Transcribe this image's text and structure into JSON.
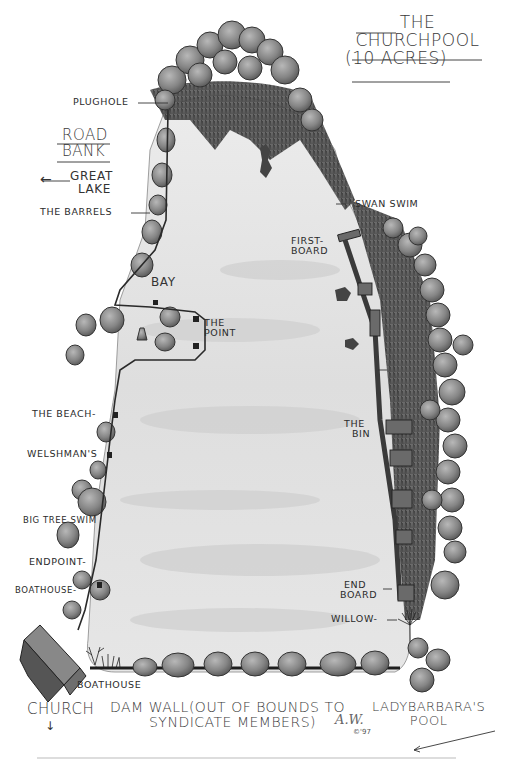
{
  "title": {
    "line1": "THE",
    "line2": "CHURCHPOOL",
    "line3": "(10 ACRES)"
  },
  "left_key": {
    "road_bank_line1": "ROAD",
    "road_bank_line2": "BANK",
    "great_lake_line1": "GREAT",
    "great_lake_line2": "LAKE",
    "great_lake_arrow": "←"
  },
  "swims": {
    "plughole": "PLUGHOLE",
    "the_barrels": "THE BARRELS",
    "bay": "BAY",
    "the_point_line1": "THE",
    "the_point_line2": "POINT",
    "the_beach": "THE BEACH-",
    "welshmans": "WELSHMAN'S",
    "big_tree_swim": "BIG TREE SWIM",
    "endpoint": "ENDPOINT-",
    "boathouse_swim": "BOATHOUSE-",
    "swan_swim": "SWAN SWIM",
    "first_board_line1": "FIRST-",
    "first_board_line2": "BOARD",
    "the_bin_line1": "THE",
    "the_bin_line2": "BIN",
    "end_board_line1": "END",
    "end_board_line2": "BOARD",
    "willow": "WILLOW-"
  },
  "bottom": {
    "boathouse": "BOATHOUSE",
    "church": "CHURCH",
    "church_arrow": "↓",
    "dam_wall_line1": "DAM WALL(OUT OF BOUNDS TO",
    "dam_wall_line2": "SYNDICATE MEMBERS)",
    "lady_barbaras_line1": "LADYBARBARA'S",
    "lady_barbaras_line2": "POOL",
    "signature": "A.W.",
    "copyright": "©'97"
  },
  "colors": {
    "water": "#e4e4e4",
    "water_shade": "#cfcfcf",
    "tree": "#8a8a8a",
    "tree_dark": "#4a4a4a",
    "reeds": "#3c3c3c",
    "ink": "#2b2b2b"
  }
}
